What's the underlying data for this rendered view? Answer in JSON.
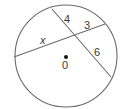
{
  "diagram": {
    "type": "circle-intersecting-chords",
    "colors": {
      "stroke": "#6b6b6b",
      "text": "#3a3a3a",
      "center_dot": "#111111",
      "background": "#ffffff"
    },
    "circle": {
      "center_label": "0",
      "cx": 66,
      "cy": 56,
      "r": 51
    },
    "chords": [
      {
        "name": "chord-x-3",
        "x1": 14,
        "y1": 57,
        "x2": 105,
        "y2": 24,
        "segments": [
          "x",
          "3"
        ]
      },
      {
        "name": "chord-4-6",
        "x1": 52,
        "y1": 9,
        "x2": 111,
        "y2": 77,
        "segments": [
          "4",
          "6"
        ]
      }
    ],
    "segment_labels": {
      "x": "x",
      "three": "3",
      "four": "4",
      "six": "6"
    }
  }
}
